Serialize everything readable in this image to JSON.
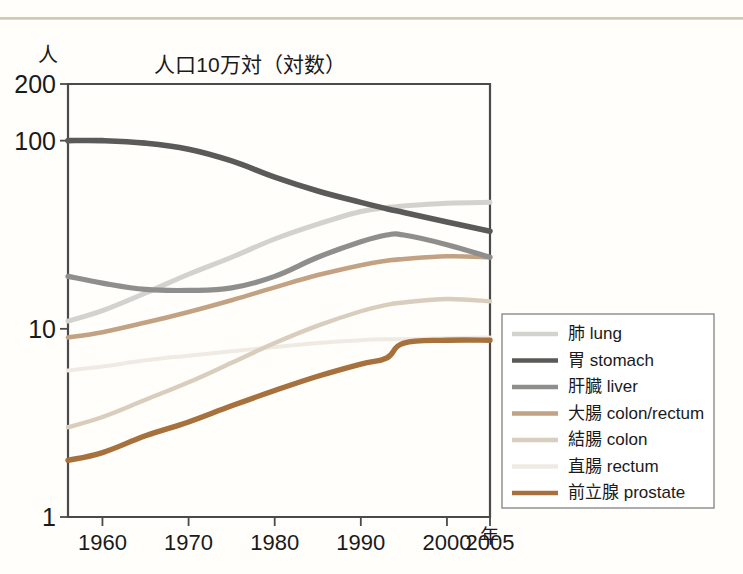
{
  "figure": {
    "title": "人口10万対（対数）",
    "y_unit": "人",
    "x_unit": "年"
  },
  "colors": {
    "lung": "#d3d2cf",
    "stomach": "#5a5a58",
    "liver": "#8e8e8c",
    "colon_rectum": "#c2a282",
    "colon": "#d9cdbe",
    "rectum": "#efeae3",
    "prostate": "#a7713e",
    "axis": "#4a4a4a",
    "legend_border": "#8a8a8a",
    "rule": "#cfc3ab"
  },
  "legend": {
    "position": "right",
    "items": [
      {
        "label": "肺 lung",
        "color_key": "lung"
      },
      {
        "label": "胃 stomach",
        "color_key": "stomach"
      },
      {
        "label": "肝臓 liver",
        "color_key": "liver"
      },
      {
        "label": "大腸 colon/rectum",
        "color_key": "colon_rectum"
      },
      {
        "label": "結腸 colon",
        "color_key": "colon"
      },
      {
        "label": "直腸 rectum",
        "color_key": "rectum"
      },
      {
        "label": "前立腺 prostate",
        "color_key": "prostate"
      }
    ]
  },
  "chart_data": {
    "type": "line",
    "title": "人口10万対（対数）",
    "xlabel": "年",
    "ylabel": "人",
    "yscale": "log",
    "ylim": [
      1,
      200
    ],
    "ytick_labels": [
      "1",
      "10",
      "100",
      "200"
    ],
    "yticks": [
      1,
      10,
      100,
      200
    ],
    "xlim": [
      1956,
      2005
    ],
    "xticks": [
      1960,
      1970,
      1980,
      1990,
      2000,
      2005
    ],
    "xtick_labels": [
      "1960",
      "1970",
      "1980",
      "1990",
      "2000",
      "2005"
    ],
    "grid": false,
    "x": [
      1956,
      1960,
      1965,
      1970,
      1975,
      1980,
      1985,
      1990,
      1993,
      1995,
      2000,
      2005
    ],
    "series": [
      {
        "name": "肺 lung",
        "values": [
          11.0,
          12.5,
          15.5,
          19.5,
          24.0,
          30.0,
          36.0,
          42.0,
          44.0,
          45.0,
          46.5,
          47.0
        ]
      },
      {
        "name": "胃 stomach",
        "values": [
          100.0,
          100.0,
          97.0,
          90.0,
          78.0,
          64.0,
          54.0,
          47.0,
          43.5,
          41.5,
          37.0,
          33.0
        ]
      },
      {
        "name": "肝臓 liver",
        "values": [
          19.0,
          17.5,
          16.2,
          16.0,
          16.5,
          19.0,
          24.0,
          29.0,
          31.5,
          31.5,
          28.0,
          24.0
        ]
      },
      {
        "name": "大腸 colon/rectum",
        "values": [
          9.0,
          9.6,
          10.8,
          12.3,
          14.2,
          16.6,
          19.3,
          21.8,
          23.0,
          23.5,
          24.3,
          24.0
        ]
      },
      {
        "name": "結腸 colon",
        "values": [
          3.0,
          3.4,
          4.2,
          5.2,
          6.6,
          8.4,
          10.4,
          12.4,
          13.4,
          13.8,
          14.4,
          14.0
        ]
      },
      {
        "name": "直腸 rectum",
        "values": [
          6.0,
          6.3,
          6.8,
          7.2,
          7.6,
          8.0,
          8.4,
          8.7,
          8.8,
          8.8,
          8.9,
          9.0
        ]
      },
      {
        "name": "前立腺 prostate",
        "values": [
          2.0,
          2.2,
          2.7,
          3.2,
          3.9,
          4.7,
          5.6,
          6.5,
          7.0,
          8.4,
          8.7,
          8.7
        ]
      }
    ]
  }
}
